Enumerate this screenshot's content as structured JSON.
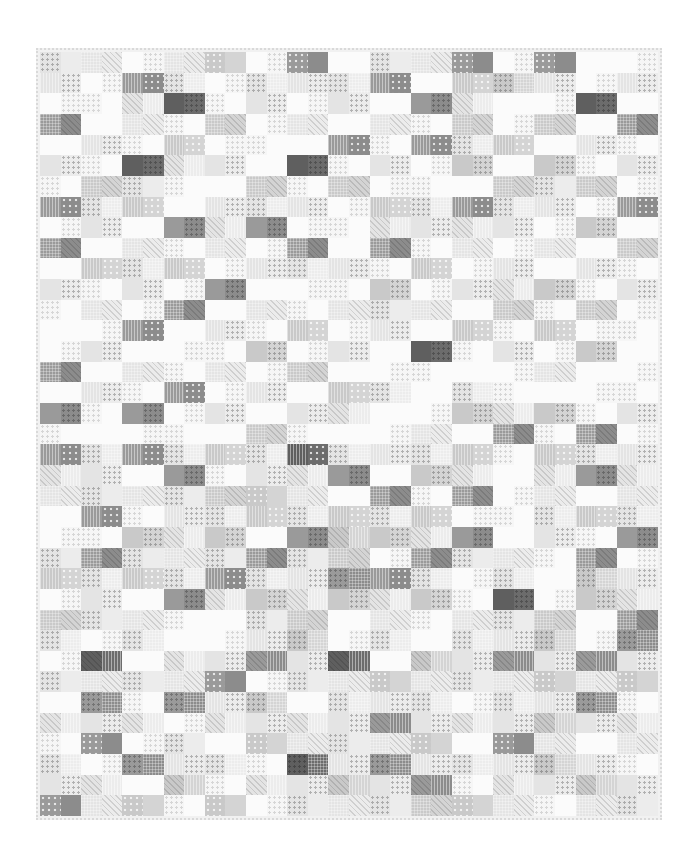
{
  "image": {
    "subject": "Grayscale patchwork quilt photographed flat on white background",
    "width": 694,
    "height": 860
  },
  "quilt": {
    "columns": 15,
    "rows": 37,
    "binding_color": "#d9d9d9",
    "background_color": "#ffffff",
    "tone_palette": [
      "#fbfbfb",
      "#e4e4e4",
      "#c9c9c9",
      "#9a9a9a",
      "#5f5f5f"
    ],
    "tone_rows": [
      [
        1,
        1,
        0,
        1,
        2,
        0,
        3,
        0,
        1,
        1,
        3,
        0,
        3,
        0,
        0
      ],
      [
        1,
        0,
        3,
        1,
        0,
        1,
        1,
        1,
        3,
        0,
        2,
        2,
        1,
        0,
        1
      ],
      [
        0,
        0,
        1,
        4,
        0,
        1,
        0,
        1,
        0,
        3,
        1,
        0,
        0,
        4,
        0
      ],
      [
        3,
        0,
        1,
        0,
        2,
        0,
        1,
        0,
        1,
        0,
        2,
        0,
        2,
        0,
        3
      ],
      [
        0,
        1,
        0,
        2,
        0,
        0,
        0,
        3,
        0,
        3,
        1,
        2,
        0,
        1,
        0
      ],
      [
        1,
        0,
        4,
        1,
        1,
        0,
        4,
        0,
        1,
        0,
        2,
        0,
        2,
        0,
        1
      ],
      [
        0,
        2,
        1,
        0,
        0,
        2,
        0,
        2,
        0,
        0,
        0,
        2,
        1,
        2,
        0
      ],
      [
        3,
        1,
        2,
        0,
        1,
        1,
        1,
        0,
        2,
        1,
        3,
        1,
        1,
        0,
        3
      ],
      [
        0,
        1,
        0,
        3,
        1,
        3,
        0,
        0,
        1,
        1,
        1,
        1,
        0,
        2,
        0
      ],
      [
        3,
        0,
        1,
        0,
        1,
        0,
        3,
        0,
        3,
        0,
        1,
        0,
        1,
        0,
        2
      ],
      [
        0,
        2,
        1,
        2,
        0,
        1,
        1,
        1,
        0,
        2,
        0,
        1,
        0,
        1,
        0
      ],
      [
        1,
        0,
        1,
        0,
        3,
        0,
        0,
        0,
        2,
        0,
        1,
        1,
        2,
        0,
        1
      ],
      [
        0,
        1,
        0,
        3,
        0,
        1,
        0,
        1,
        1,
        1,
        0,
        2,
        0,
        2,
        0
      ],
      [
        0,
        0,
        3,
        0,
        1,
        0,
        2,
        0,
        1,
        0,
        2,
        0,
        2,
        0,
        0
      ],
      [
        0,
        1,
        0,
        0,
        0,
        2,
        0,
        1,
        0,
        4,
        0,
        1,
        0,
        2,
        0
      ],
      [
        3,
        0,
        1,
        0,
        1,
        0,
        2,
        0,
        0,
        0,
        0,
        0,
        1,
        0,
        0
      ],
      [
        0,
        1,
        0,
        3,
        0,
        1,
        0,
        2,
        1,
        0,
        1,
        0,
        0,
        0,
        0
      ],
      [
        3,
        0,
        3,
        0,
        1,
        0,
        1,
        1,
        0,
        0,
        2,
        1,
        2,
        0,
        1
      ],
      [
        0,
        0,
        0,
        0,
        0,
        2,
        0,
        0,
        0,
        1,
        0,
        3,
        0,
        3,
        0
      ],
      [
        3,
        1,
        3,
        1,
        2,
        1,
        4,
        1,
        1,
        1,
        2,
        0,
        2,
        1,
        1
      ],
      [
        1,
        1,
        0,
        3,
        0,
        1,
        1,
        3,
        0,
        2,
        1,
        0,
        1,
        3,
        1
      ],
      [
        1,
        1,
        1,
        1,
        2,
        2,
        1,
        0,
        3,
        0,
        3,
        0,
        1,
        0,
        1
      ],
      [
        0,
        3,
        0,
        1,
        1,
        2,
        1,
        2,
        1,
        2,
        0,
        0,
        1,
        2,
        1
      ],
      [
        0,
        0,
        2,
        1,
        2,
        0,
        3,
        2,
        2,
        1,
        3,
        0,
        1,
        0,
        3
      ],
      [
        1,
        3,
        1,
        1,
        1,
        3,
        1,
        2,
        0,
        3,
        1,
        1,
        0,
        3,
        0
      ],
      [
        2,
        1,
        2,
        1,
        3,
        1,
        1,
        3,
        3,
        1,
        0,
        1,
        0,
        2,
        1
      ],
      [
        0,
        1,
        0,
        3,
        1,
        2,
        1,
        2,
        1,
        2,
        0,
        4,
        0,
        2,
        1
      ],
      [
        2,
        1,
        1,
        0,
        0,
        1,
        2,
        0,
        1,
        0,
        1,
        1,
        2,
        0,
        3
      ],
      [
        1,
        0,
        1,
        0,
        0,
        1,
        2,
        0,
        1,
        0,
        1,
        1,
        2,
        0,
        3
      ],
      [
        0,
        4,
        0,
        1,
        1,
        3,
        1,
        4,
        0,
        2,
        1,
        3,
        1,
        3,
        1
      ],
      [
        1,
        1,
        1,
        1,
        3,
        0,
        1,
        1,
        2,
        1,
        1,
        1,
        2,
        1,
        2
      ],
      [
        0,
        3,
        0,
        3,
        1,
        2,
        0,
        1,
        1,
        1,
        0,
        1,
        1,
        3,
        0
      ],
      [
        1,
        1,
        1,
        0,
        1,
        1,
        1,
        1,
        3,
        1,
        1,
        1,
        2,
        1,
        1
      ],
      [
        0,
        3,
        0,
        1,
        0,
        2,
        1,
        1,
        1,
        2,
        0,
        3,
        1,
        0,
        1
      ],
      [
        1,
        0,
        3,
        1,
        1,
        0,
        4,
        1,
        3,
        1,
        1,
        1,
        2,
        1,
        0
      ],
      [
        1,
        1,
        0,
        2,
        0,
        1,
        1,
        2,
        1,
        3,
        0,
        1,
        1,
        2,
        1
      ],
      [
        3,
        1,
        2,
        0,
        2,
        0,
        1,
        1,
        1,
        2,
        2,
        1,
        0,
        1,
        1
      ]
    ],
    "patterns": [
      "dots",
      "stripes",
      "diag",
      "check",
      "dots-dark",
      "none"
    ]
  }
}
